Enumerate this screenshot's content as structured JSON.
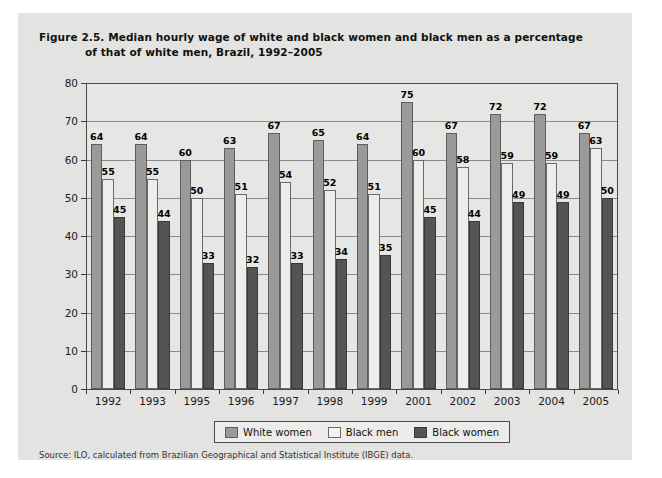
{
  "figure": {
    "title_line1": "Figure 2.5.  Median hourly wage of white and black women and black men as a percentage",
    "title_line2": "of that of white men, Brazil, 1992–2005",
    "source": "Source: ILO, calculated from Brazilian Geographical and Statistical Institute (IBGE) data."
  },
  "legend": {
    "position": "bottom-center",
    "items": [
      {
        "label": "White women",
        "color": "#9a9a9a",
        "swatch": "white-women"
      },
      {
        "label": "Black men",
        "color": "#f2f2f0",
        "swatch": "black-men"
      },
      {
        "label": "Black women",
        "color": "#545454",
        "swatch": "black-women"
      }
    ]
  },
  "chart_data": {
    "type": "bar",
    "title": "Figure 2.5.  Median hourly wage of white and black women and black men as a percentage of that of white men, Brazil, 1992–2005",
    "xlabel": "",
    "ylabel": "",
    "ylim": [
      0,
      80
    ],
    "ytick_step": 10,
    "yticks": [
      0,
      10,
      20,
      30,
      40,
      50,
      60,
      70,
      80
    ],
    "ytick_labels": [
      "0",
      "10",
      "20",
      "30",
      "40",
      "50",
      "60",
      "70",
      "80"
    ],
    "grid": true,
    "grid_axis": "y",
    "categories": [
      "1992",
      "1993",
      "1995",
      "1996",
      "1997",
      "1998",
      "1999",
      "2001",
      "2002",
      "2003",
      "2004",
      "2005"
    ],
    "series": [
      {
        "name": "White women",
        "color": "#9a9a9a",
        "values": [
          64,
          64,
          60,
          63,
          67,
          65,
          64,
          75,
          67,
          72,
          72,
          67
        ]
      },
      {
        "name": "Black men",
        "color": "#f2f2f0",
        "values": [
          55,
          55,
          50,
          51,
          54,
          52,
          51,
          60,
          58,
          59,
          59,
          63
        ]
      },
      {
        "name": "Black women",
        "color": "#545454",
        "values": [
          45,
          44,
          33,
          32,
          33,
          34,
          35,
          45,
          44,
          49,
          49,
          50
        ]
      }
    ],
    "data_labels": true,
    "source": "Source: ILO, calculated from Brazilian Geographical and Statistical Institute (IBGE) data."
  }
}
